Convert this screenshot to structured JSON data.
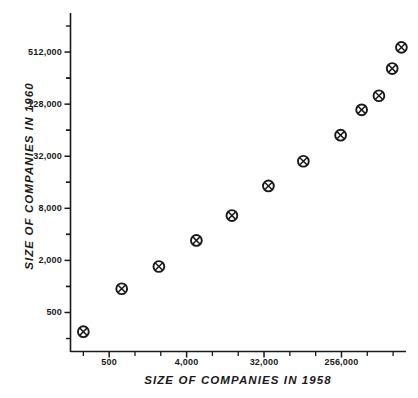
{
  "chart_data": {
    "type": "scatter",
    "title": "",
    "xlabel": "SIZE OF COMPANIES IN 1958",
    "ylabel": "SIZE OF COMPANIES IN 1960",
    "xscale": "log2",
    "yscale": "log2",
    "grid": false,
    "legend": null,
    "marker": "circled-x",
    "xlim": [
      177,
      1448000
    ],
    "ylim": [
      177,
      1448000
    ],
    "xticks": [
      {
        "value": 500,
        "label": "500"
      },
      {
        "value": 4000,
        "label": "4,000"
      },
      {
        "value": 32000,
        "label": "32,000"
      },
      {
        "value": 256000,
        "label": "256,000"
      }
    ],
    "yticks": [
      {
        "value": 500,
        "label": "500"
      },
      {
        "value": 2000,
        "label": "2,000"
      },
      {
        "value": 8000,
        "label": "8,000"
      },
      {
        "value": 32000,
        "label": "32,000"
      },
      {
        "value": 128000,
        "label": "128,000"
      },
      {
        "value": 512000,
        "label": "512,000"
      }
    ],
    "x": [
      250,
      700,
      1900,
      5200,
      13500,
      36000,
      92000,
      250000,
      440000,
      700000,
      1000000,
      1280000
    ],
    "y": [
      300,
      940,
      1700,
      3400,
      6600,
      14500,
      28000,
      56000,
      110000,
      160000,
      330000,
      580000
    ],
    "points": [
      {
        "x": 250,
        "y": 300
      },
      {
        "x": 700,
        "y": 940
      },
      {
        "x": 1900,
        "y": 1700
      },
      {
        "x": 5200,
        "y": 3400
      },
      {
        "x": 13500,
        "y": 6600
      },
      {
        "x": 36000,
        "y": 14500
      },
      {
        "x": 92000,
        "y": 28000
      },
      {
        "x": 250000,
        "y": 56000
      },
      {
        "x": 440000,
        "y": 110000
      },
      {
        "x": 700000,
        "y": 160000
      },
      {
        "x": 1000000,
        "y": 330000
      },
      {
        "x": 1280000,
        "y": 580000
      }
    ],
    "colors": {
      "axis": "#1a1a1a",
      "marker_stroke": "#1a1a1a",
      "background": "#ffffff"
    }
  },
  "axes": {
    "y_title": "SIZE OF COMPANIES IN 1960",
    "x_title": "SIZE OF COMPANIES IN 1958"
  }
}
